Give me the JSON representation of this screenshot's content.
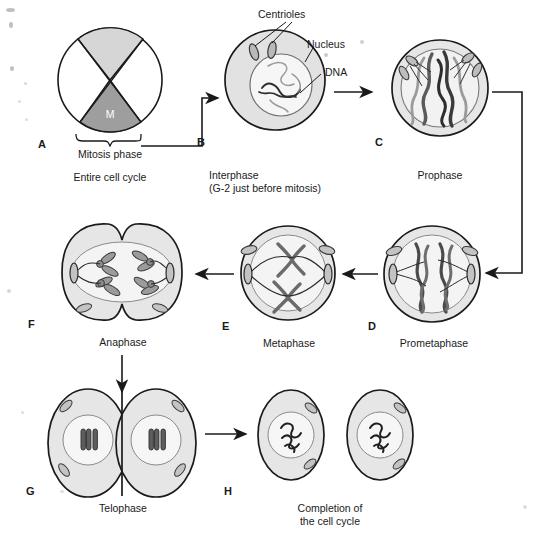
{
  "figure": {
    "type": "biological-process-diagram",
    "background": "#ffffff",
    "ink": "#1a1a1a"
  },
  "palette": {
    "outline": "#1a1a1a",
    "cytoplasm_fill": "#e2e2e2",
    "nucleus_fill": "#f4f4f4",
    "wedge_light": "#d6d6d6",
    "wedge_dark": "#9e9e9e",
    "chromosome_dark": "#4a4a4a",
    "chromosome_light": "#b5b5b5",
    "centriole_fill": "#b9b9b9",
    "arrow": "#1a1a1a"
  },
  "panels": [
    {
      "key": "A",
      "letter": "A",
      "caption": "Entire cell cycle",
      "subcaption": "",
      "bracket_label": "Mitosis phase",
      "wedge_label": "M",
      "kind": "pie"
    },
    {
      "key": "B",
      "letter": "B",
      "caption": "Interphase",
      "subcaption": "(G-2 just before mitosis)",
      "kind": "cell"
    },
    {
      "key": "C",
      "letter": "C",
      "caption": "Prophase",
      "subcaption": "",
      "kind": "cell"
    },
    {
      "key": "D",
      "letter": "D",
      "caption": "Prometaphase",
      "subcaption": "",
      "kind": "cell"
    },
    {
      "key": "E",
      "letter": "E",
      "caption": "Metaphase",
      "subcaption": "",
      "kind": "cell"
    },
    {
      "key": "F",
      "letter": "F",
      "caption": "Anaphase",
      "subcaption": "",
      "kind": "cell"
    },
    {
      "key": "G",
      "letter": "G",
      "caption": "Telophase",
      "subcaption": "",
      "kind": "cell"
    },
    {
      "key": "H",
      "letter": "H",
      "caption": "Completion of",
      "subcaption": "the cell cycle",
      "kind": "cell"
    }
  ],
  "callouts": [
    {
      "key": "centrioles",
      "label": "Centrioles"
    },
    {
      "key": "nucleus",
      "label": "Nucleus"
    },
    {
      "key": "dna",
      "label": "DNA"
    }
  ],
  "flow": [
    {
      "from": "A",
      "to": "B"
    },
    {
      "from": "B",
      "to": "C"
    },
    {
      "from": "C",
      "to": "D"
    },
    {
      "from": "D",
      "to": "E"
    },
    {
      "from": "E",
      "to": "F"
    },
    {
      "from": "F",
      "to": "G"
    },
    {
      "from": "G",
      "to": "H"
    }
  ]
}
